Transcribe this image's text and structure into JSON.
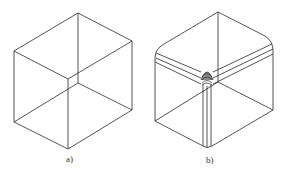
{
  "figure": {
    "panels": [
      {
        "label": "a)",
        "description": "wireframe cube with sharp edges"
      },
      {
        "label": "b)",
        "description": "cube with filleted (rounded) edges and corner blend"
      }
    ],
    "colors": {
      "stroke": "#2a2a2a",
      "background": "#ffffff",
      "fillet_fill": "#555555"
    }
  }
}
